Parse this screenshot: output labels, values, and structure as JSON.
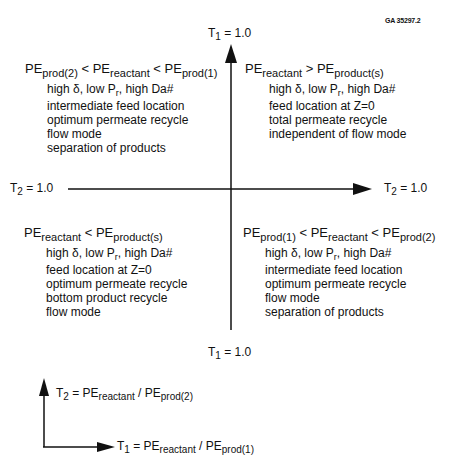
{
  "figure_id": "GA 35297.2",
  "axes": {
    "vertical_top_label": {
      "base": "T",
      "sub": "1",
      "rest": " = 1.0"
    },
    "vertical_bottom_label": {
      "base": "T",
      "sub": "1",
      "rest": " = 1.0"
    },
    "horizontal_left_label": {
      "base": "T",
      "sub": "2",
      "rest": " = 1.0"
    },
    "horizontal_right_label": {
      "base": "T",
      "sub": "2",
      "rest": " = 1.0"
    }
  },
  "quadrants": {
    "top_left": {
      "condition": [
        {
          "t": "PE",
          "s": "prod(2)"
        },
        {
          "op": " < "
        },
        {
          "t": "PE",
          "s": "reactant"
        },
        {
          "op": " < "
        },
        {
          "t": "PE",
          "s": "prod(1)"
        }
      ],
      "params": {
        "a": "high δ, low P",
        "sub": "r",
        "b": ", high Da#"
      },
      "lines": [
        "intermediate feed location",
        "optimum permeate recycle",
        "flow mode",
        "separation of products"
      ]
    },
    "top_right": {
      "condition": [
        {
          "t": "PE",
          "s": "reactant"
        },
        {
          "op": " > "
        },
        {
          "t": "PE",
          "s": "product(s)"
        }
      ],
      "params": {
        "a": "high δ, low P",
        "sub": "r",
        "b": ", high Da#"
      },
      "lines": [
        "feed location at Z=0",
        "total permeate recycle",
        "independent of flow mode"
      ]
    },
    "bottom_left": {
      "condition": [
        {
          "t": "PE",
          "s": "reactant"
        },
        {
          "op": " < "
        },
        {
          "t": "PE",
          "s": "product(s)"
        }
      ],
      "params": {
        "a": "high δ, low P",
        "sub": "r",
        "b": ", high Da#"
      },
      "lines": [
        "feed location at Z=0",
        "optimum permeate recycle",
        "bottom product recycle",
        "flow mode"
      ]
    },
    "bottom_right": {
      "condition": [
        {
          "t": "PE",
          "s": "prod(1)"
        },
        {
          "op": " < "
        },
        {
          "t": "PE",
          "s": "reactant"
        },
        {
          "op": " < "
        },
        {
          "t": "PE",
          "s": "prod(2)"
        }
      ],
      "params": {
        "a": "high δ, low P",
        "sub": "r",
        "b": ", high Da#"
      },
      "lines": [
        "intermediate feed location",
        "optimum permeate recycle",
        "flow mode",
        "separation of products"
      ]
    }
  },
  "legend": {
    "t2": {
      "lhs": "T",
      "lhs_sub": "2",
      "eq": " = PE",
      "num_sub": "reactant",
      "div": " / PE",
      "den_sub": "prod(2)"
    },
    "t1": {
      "lhs": "T",
      "lhs_sub": "1",
      "eq": " = PE",
      "num_sub": "reactant",
      "div": " / PE",
      "den_sub": "prod(1)"
    }
  },
  "colors": {
    "ink": "#111111",
    "background": "#ffffff"
  }
}
